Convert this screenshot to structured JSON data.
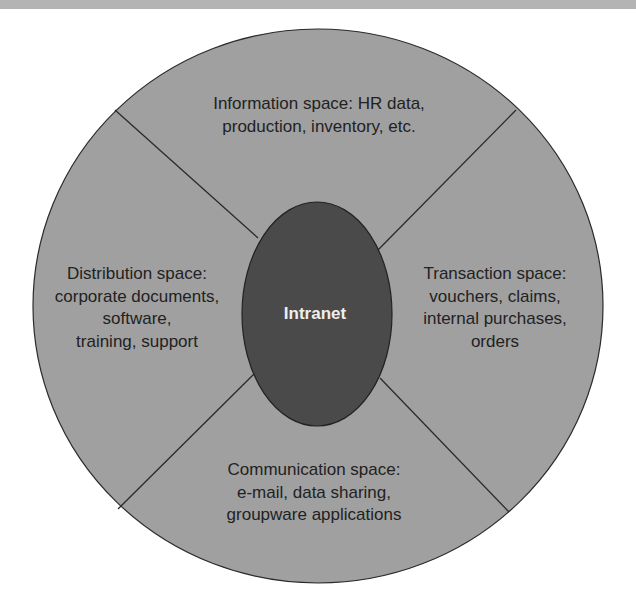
{
  "diagram": {
    "center": {
      "label": "Intranet",
      "color": "#4a4a4a",
      "text_color": "#eeeeee"
    },
    "outer_circle_color": "#a0a0a0",
    "line_color": "#2a2a2a",
    "sectors": [
      {
        "position": "top",
        "lines": [
          "Information space: HR data,",
          "production, inventory, etc."
        ]
      },
      {
        "position": "left",
        "lines": [
          "Distribution space:",
          "corporate documents,",
          "software,",
          "training, support"
        ]
      },
      {
        "position": "right",
        "lines": [
          "Transaction space:",
          "vouchers, claims,",
          "internal purchases,",
          "orders"
        ]
      },
      {
        "position": "bottom",
        "lines": [
          "Communication space:",
          "e-mail, data sharing,",
          "groupware applications"
        ]
      }
    ]
  }
}
